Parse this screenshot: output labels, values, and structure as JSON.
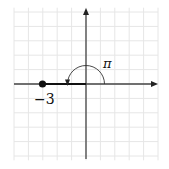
{
  "diagram": {
    "type": "complex-plane-polar",
    "grid": {
      "xmin": -5,
      "xmax": 5,
      "ymin": -5,
      "ymax": 5,
      "color": "#e6e6e6"
    },
    "axes": {
      "color": "#333333"
    },
    "point": {
      "value": -3,
      "label": "−3"
    },
    "angle": {
      "label": "π",
      "from": 0,
      "to": 3.14159
    },
    "segment_color": "#111111"
  }
}
